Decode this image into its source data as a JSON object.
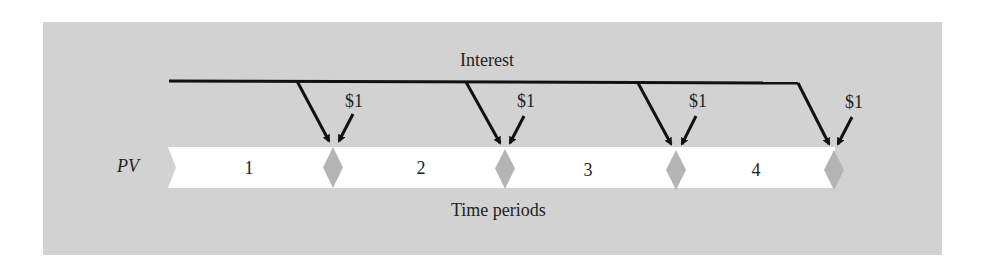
{
  "diagram": {
    "title_label": "Interest",
    "axis_label": "Time periods",
    "start_label": "PV",
    "periods": [
      "1",
      "2",
      "3",
      "4"
    ],
    "payments": [
      "$1",
      "$1",
      "$1",
      "$1"
    ],
    "colors": {
      "panel": "#d2d2d2",
      "band": "#ffffff",
      "diamond": "#b4b4b4",
      "line": "#111111"
    }
  }
}
